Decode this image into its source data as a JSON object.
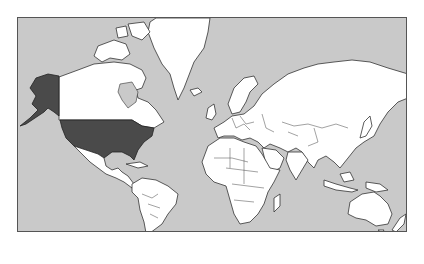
{
  "map": {
    "title": "World map",
    "projection": "Mercator",
    "highlighted_country": "United States",
    "highlighted_regions": [
      "Contiguous United States",
      "Alaska"
    ],
    "colors": {
      "ocean": "#c9c9c9",
      "land": "#ffffff",
      "highlight": "#4a4a4a",
      "border": "#333333"
    },
    "continents": [
      "North America",
      "South America",
      "Greenland",
      "Europe",
      "Africa",
      "Asia",
      "Australia"
    ]
  }
}
